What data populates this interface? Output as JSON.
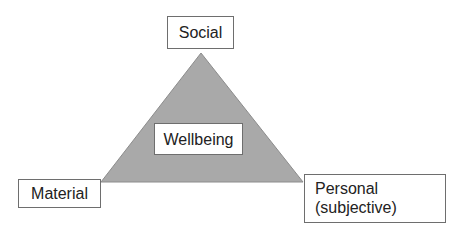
{
  "diagram": {
    "shape": "triangle",
    "fill_color": "#a9a9a9",
    "edge_color": "#8c8c8c",
    "center_label": "Wellbeing",
    "vertices": {
      "top": "Social",
      "bottom_left": "Material",
      "bottom_right": {
        "line1": "Personal",
        "line2": "(subjective)"
      }
    }
  }
}
